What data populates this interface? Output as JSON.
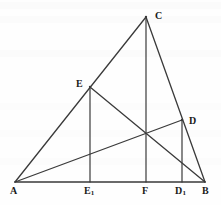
{
  "figure": {
    "type": "geometry-diagram",
    "background_color": "#fefefe",
    "line_color": "#3a3a3a",
    "label_color": "#1a1a1a",
    "baseline_color": "#3a3a3a"
  },
  "points": [
    {
      "id": "A",
      "label": "A",
      "sub": "",
      "x": 15,
      "y": 182,
      "label_x": 10,
      "label_y": 186
    },
    {
      "id": "B",
      "label": "B",
      "sub": "",
      "x": 205,
      "y": 182,
      "label_x": 202,
      "label_y": 186
    },
    {
      "id": "C",
      "label": "C",
      "sub": "",
      "x": 146,
      "y": 17,
      "label_x": 155,
      "label_y": 11
    },
    {
      "id": "D",
      "label": "D",
      "sub": "",
      "x": 182,
      "y": 120,
      "label_x": 189,
      "label_y": 116
    },
    {
      "id": "E",
      "label": "E",
      "sub": "",
      "x": 90,
      "y": 87,
      "label_x": 76,
      "label_y": 79
    },
    {
      "id": "E1",
      "label": "E",
      "sub": "1",
      "x": 90,
      "y": 182,
      "label_x": 84,
      "label_y": 186
    },
    {
      "id": "F",
      "label": "F",
      "sub": "",
      "x": 146,
      "y": 182,
      "label_x": 142,
      "label_y": 186
    },
    {
      "id": "D1",
      "label": "D",
      "sub": "1",
      "x": 182,
      "y": 182,
      "label_x": 175,
      "label_y": 186
    }
  ],
  "segments": [
    {
      "name": "side-AB-baseline",
      "from": "A",
      "to": "B",
      "width": 1.6
    },
    {
      "name": "side-AC",
      "from": "A",
      "to": "C",
      "width": 1.3
    },
    {
      "name": "side-CB",
      "from": "C",
      "to": "B",
      "width": 1.3
    },
    {
      "name": "altitude-CF",
      "from": "C",
      "to": "F",
      "width": 1.2
    },
    {
      "name": "perpendicular-EE1",
      "from": "E",
      "to": "E1",
      "width": 1.2
    },
    {
      "name": "perpendicular-DD1",
      "from": "D",
      "to": "D1",
      "width": 1.2
    },
    {
      "name": "cevian-AD",
      "from": "A",
      "to": "D",
      "width": 1.3
    },
    {
      "name": "cevian-EB",
      "from": "E",
      "to": "B",
      "width": 1.3
    }
  ],
  "ghost_bands": [
    {
      "top": 2,
      "opacity": 0.5
    },
    {
      "top": 16,
      "opacity": 0.4
    },
    {
      "top": 50,
      "opacity": 0.35
    },
    {
      "top": 103,
      "opacity": 0.3
    },
    {
      "top": 130,
      "opacity": 0.3
    },
    {
      "top": 158,
      "opacity": 0.3
    }
  ]
}
